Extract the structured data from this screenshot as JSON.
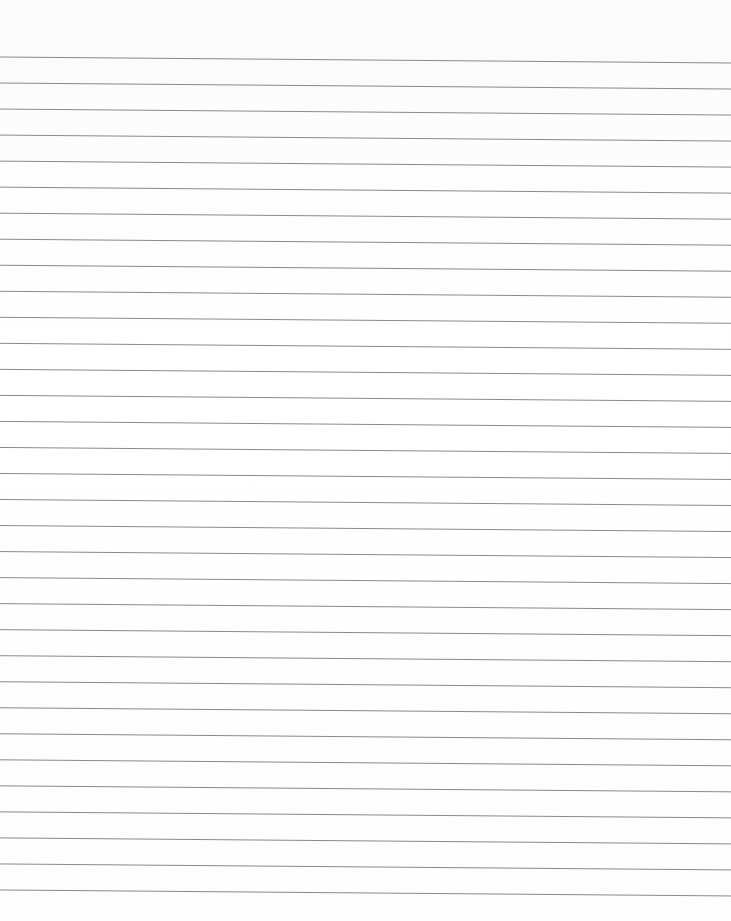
{
  "page": {
    "type": "lined-paper",
    "background_color": "#fdfdfd",
    "line_color": "#8a8a8a",
    "line_count": 33,
    "first_line_y_left": 57,
    "first_line_y_right": 63,
    "line_spacing": 26.03
  }
}
